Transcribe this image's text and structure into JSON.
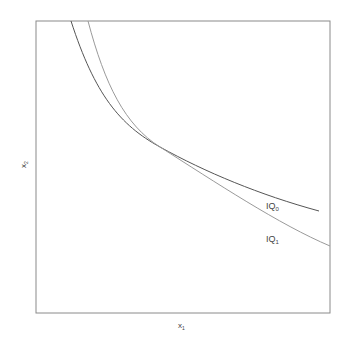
{
  "diagram": {
    "x_axis_label": "x",
    "x_axis_sub": "1",
    "y_axis_label": "x",
    "y_axis_sub": "2",
    "curves": [
      {
        "id": "IQ0",
        "label": "IQ",
        "label_sub": "0",
        "color": "#555555"
      },
      {
        "id": "IQ1",
        "label": "IQ",
        "label_sub": "1",
        "color": "#9a9a9a"
      }
    ],
    "frame_color": "#8a8a8a"
  }
}
